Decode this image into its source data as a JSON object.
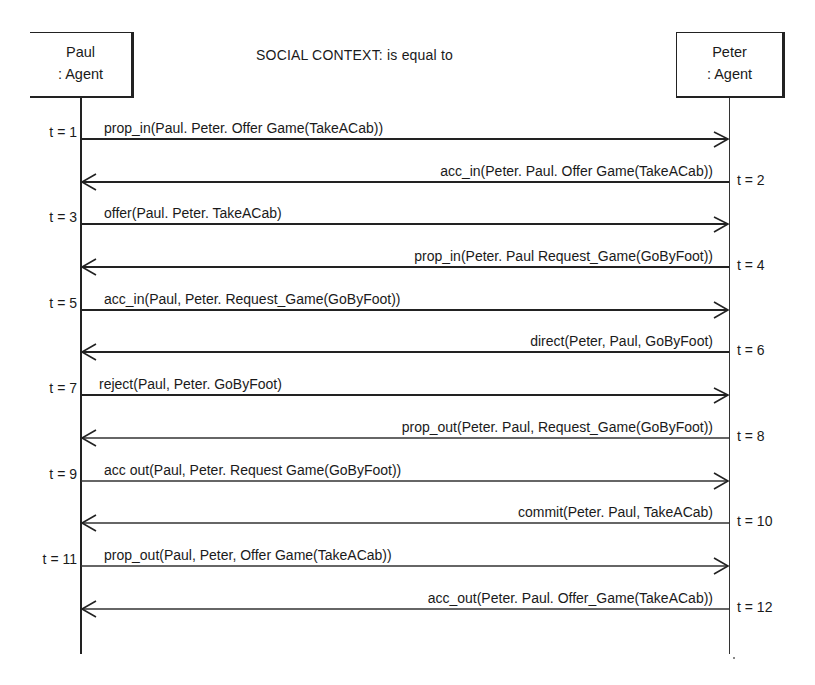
{
  "diagram": {
    "type": "sequence",
    "title": "SOCIAL CONTEXT: is equal to",
    "participants": [
      {
        "id": "paul",
        "name": "Paul",
        "type": ": Agent"
      },
      {
        "id": "peter",
        "name": "Peter",
        "type": ": Agent"
      }
    ],
    "messages": [
      {
        "t": "t = 1",
        "from": "paul",
        "to": "peter",
        "label": "prop_in(Paul. Peter. Offer  Game(TakeACab))"
      },
      {
        "t": "t = 2",
        "from": "peter",
        "to": "paul",
        "label": "acc_in(Peter. Paul. Offer  Game(TakeACab))"
      },
      {
        "t": "t = 3",
        "from": "paul",
        "to": "peter",
        "label": "offer(Paul. Peter. TakeACab)"
      },
      {
        "t": "t = 4",
        "from": "peter",
        "to": "paul",
        "label": "prop_in(Peter. Paul  Request_Game(GoByFoot))"
      },
      {
        "t": "t = 5",
        "from": "paul",
        "to": "peter",
        "label": "acc_in(Paul, Peter. Request_Game(GoByFoot))"
      },
      {
        "t": "t = 6",
        "from": "peter",
        "to": "paul",
        "label": "direct(Peter, Paul, GoByFoot)"
      },
      {
        "t": "t = 7",
        "from": "paul",
        "to": "peter",
        "label": "reject(Paul, Peter. GoByFoot)"
      },
      {
        "t": "t = 8",
        "from": "peter",
        "to": "paul",
        "label": "prop_out(Peter. Paul, Request_Game(GoByFoot))"
      },
      {
        "t": "t = 9",
        "from": "paul",
        "to": "peter",
        "label": "acc  out(Paul, Peter. Request  Game(GoByFoot))"
      },
      {
        "t": "t = 10",
        "from": "peter",
        "to": "paul",
        "label": "commit(Peter. Paul, TakeACab)"
      },
      {
        "t": "t = 11",
        "from": "paul",
        "to": "peter",
        "label": "prop_out(Paul, Peter, Offer  Game(TakeACab))"
      },
      {
        "t": "t = 12",
        "from": "peter",
        "to": "paul",
        "label": "acc_out(Peter. Paul. Offer_Game(TakeACab))"
      }
    ]
  }
}
